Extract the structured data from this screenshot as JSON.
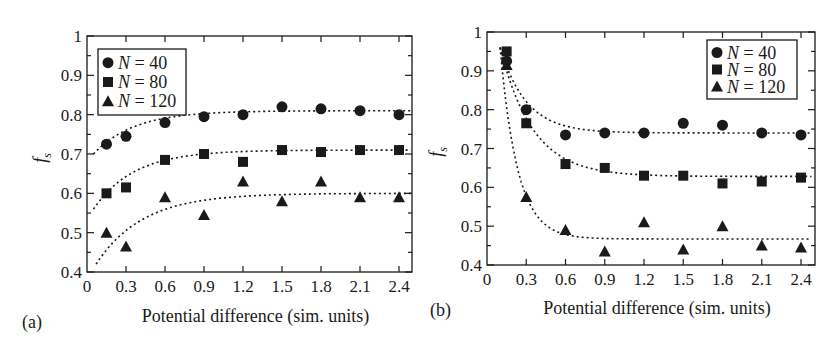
{
  "figure": {
    "panels": [
      "(a)",
      "(b)"
    ]
  },
  "chart_data": [
    {
      "type": "scatter",
      "panel_label": "(a)",
      "title": "",
      "xlabel": "Potential difference (sim. units)",
      "ylabel": "f_s",
      "xlim": [
        0,
        2.5
      ],
      "ylim": [
        0.4,
        1.0
      ],
      "xticks": [
        "0",
        "0.3",
        "0.6",
        "0.9",
        "1.2",
        "1.5",
        "1.8",
        "2.1",
        "2.4"
      ],
      "yticks": [
        "0.4",
        "0.5",
        "0.6",
        "0.7",
        "0.8",
        "0.9",
        "1"
      ],
      "legend_position": "upper left",
      "grid": false,
      "x": [
        0.15,
        0.3,
        0.6,
        0.9,
        1.2,
        1.5,
        1.8,
        2.1,
        2.4
      ],
      "series": [
        {
          "name": "N = 40",
          "marker": "circle",
          "values": [
            0.725,
            0.745,
            0.78,
            0.795,
            0.8,
            0.82,
            0.815,
            0.81,
            0.8
          ],
          "fit": "dotted saturating curve from ~0.70 to ~0.81"
        },
        {
          "name": "N = 80",
          "marker": "square",
          "values": [
            0.6,
            0.615,
            0.685,
            0.7,
            0.68,
            0.71,
            0.705,
            0.71,
            0.71
          ],
          "fit": "dotted saturating curve from ~0.56 to ~0.71"
        },
        {
          "name": "N = 120",
          "marker": "triangle",
          "values": [
            0.5,
            0.465,
            0.59,
            0.545,
            0.63,
            0.58,
            0.63,
            0.59,
            0.59
          ],
          "fit": "dotted saturating curve from ~0.42 to ~0.60"
        }
      ]
    },
    {
      "type": "scatter",
      "panel_label": "(b)",
      "title": "",
      "xlabel": "Potential difference (sim. units)",
      "ylabel": "f_s",
      "xlim": [
        0,
        2.5
      ],
      "ylim": [
        0.4,
        1.0
      ],
      "xticks": [
        "0",
        "0.3",
        "0.6",
        "0.9",
        "1.2",
        "1.5",
        "1.8",
        "2.1",
        "2.4"
      ],
      "yticks": [
        "0.4",
        "0.5",
        "0.6",
        "0.7",
        "0.8",
        "0.9",
        "1"
      ],
      "legend_position": "upper right",
      "grid": false,
      "x": [
        0.15,
        0.3,
        0.6,
        0.9,
        1.2,
        1.5,
        1.8,
        2.1,
        2.4
      ],
      "series": [
        {
          "name": "N = 40",
          "marker": "circle",
          "values": [
            0.925,
            0.8,
            0.735,
            0.74,
            0.74,
            0.765,
            0.76,
            0.74,
            0.735
          ],
          "fit": "dotted decaying curve from ~0.96 to ~0.74"
        },
        {
          "name": "N = 80",
          "marker": "square",
          "values": [
            0.95,
            0.765,
            0.66,
            0.65,
            0.63,
            0.63,
            0.61,
            0.615,
            0.625
          ],
          "fit": "dotted decaying curve from ~0.96 to ~0.63"
        },
        {
          "name": "N = 120",
          "marker": "triangle",
          "values": [
            0.915,
            0.575,
            0.49,
            0.435,
            0.51,
            0.44,
            0.5,
            0.45,
            0.445
          ],
          "fit": "dotted decaying curve from ~0.96 to ~0.47"
        }
      ]
    }
  ],
  "fits": [
    [
      {
        "start": 0.7,
        "end": 0.81,
        "k": 3.2,
        "x0": 0.05
      },
      {
        "start": 0.56,
        "end": 0.71,
        "k": 3.2,
        "x0": 0.05
      },
      {
        "start": 0.42,
        "end": 0.6,
        "k": 2.8,
        "x0": 0.07
      }
    ],
    [
      {
        "start": 0.96,
        "end": 0.74,
        "k": 5.0,
        "x0": 0.1
      },
      {
        "start": 0.96,
        "end": 0.628,
        "k": 4.0,
        "x0": 0.1
      },
      {
        "start": 0.96,
        "end": 0.467,
        "k": 7.5,
        "x0": 0.1
      }
    ]
  ]
}
